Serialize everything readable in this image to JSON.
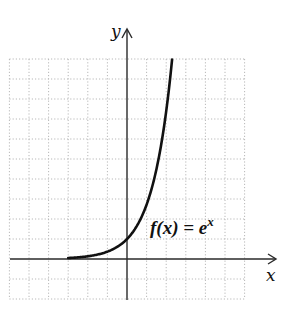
{
  "chart_data": {
    "type": "line",
    "title": "",
    "xlabel": "x",
    "ylabel": "y",
    "annotation": "f(x) = e^x",
    "function": "e^x",
    "grid": true,
    "xlim": [
      -6,
      6
    ],
    "ylim": [
      -2,
      10
    ],
    "x": [
      -3,
      -2.5,
      -2,
      -1.5,
      -1,
      -0.5,
      0,
      0.5,
      1,
      1.5,
      2,
      2.3
    ],
    "values": [
      0.05,
      0.08,
      0.14,
      0.22,
      0.37,
      0.61,
      1.0,
      1.65,
      2.72,
      4.48,
      7.39,
      9.97
    ],
    "series": [
      {
        "name": "f(x) = e^x",
        "x": [
          -3,
          -2,
          -1,
          0,
          1,
          2,
          2.3
        ],
        "values": [
          0.05,
          0.14,
          0.37,
          1.0,
          2.72,
          7.39,
          9.97
        ]
      }
    ]
  },
  "labels": {
    "x_axis": "x",
    "y_axis": "y",
    "fn_main": "f(x) = e",
    "fn_exp": "x"
  }
}
